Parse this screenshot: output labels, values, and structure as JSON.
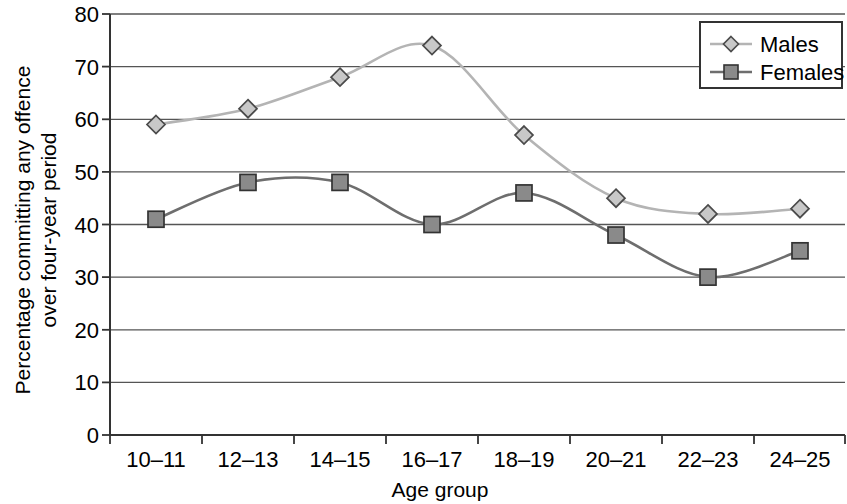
{
  "chart_data": {
    "type": "line",
    "title": "",
    "subtitle": "",
    "xlabel": "Age group",
    "ylabel": "Percentage committing any offence over four-year period",
    "ylabel_line1": "Percentage committing any offence",
    "ylabel_line2": "over four-year period",
    "categories": [
      "10–11",
      "12–13",
      "14–15",
      "16–17",
      "18–19",
      "20–21",
      "22–23",
      "24–25"
    ],
    "series": [
      {
        "name": "Males",
        "values": [
          59,
          62,
          68,
          74,
          57,
          45,
          42,
          43
        ],
        "marker": "diamond",
        "color": "#b4b4b4",
        "marker_fill": "#c8c8c8",
        "marker_stroke": "#4a4a4a"
      },
      {
        "name": "Females",
        "values": [
          41,
          48,
          48,
          40,
          46,
          38,
          30,
          35
        ],
        "marker": "square",
        "color": "#6e6e6e",
        "marker_fill": "#8a8a8a",
        "marker_stroke": "#333333"
      }
    ],
    "ylim": [
      0,
      80
    ],
    "ytick_step": 10,
    "yticks": [
      "0",
      "10",
      "20",
      "30",
      "40",
      "50",
      "60",
      "70",
      "80"
    ],
    "grid": true,
    "grid_color": "#555555",
    "smooth": true,
    "legend_position": "top-right",
    "legend_entries": [
      "Males",
      "Females"
    ]
  },
  "legend": {
    "males_label": "Males",
    "females_label": "Females"
  },
  "axes": {
    "x_title": "Age group",
    "y_title_line1": "Percentage committing any offence",
    "y_title_line2": "over four-year period"
  }
}
